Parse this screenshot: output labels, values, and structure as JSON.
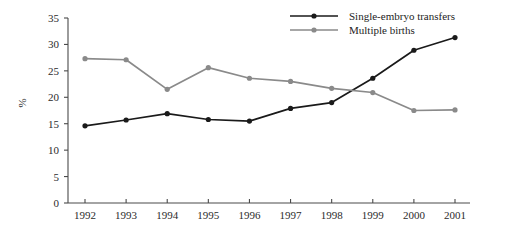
{
  "chart_data": {
    "type": "line",
    "title": "",
    "xlabel": "",
    "ylabel": "%",
    "categories": [
      "1992",
      "1993",
      "1994",
      "1995",
      "1996",
      "1997",
      "1998",
      "1999",
      "2000",
      "2001"
    ],
    "x": [
      1992,
      1993,
      1994,
      1995,
      1996,
      1997,
      1998,
      1999,
      2000,
      2001
    ],
    "series": [
      {
        "name": "Single-embryo transfers",
        "color": "#1a1a1a",
        "values": [
          14.6,
          15.7,
          16.9,
          15.8,
          15.5,
          17.9,
          19.0,
          23.6,
          28.9,
          31.3
        ]
      },
      {
        "name": "Multiple births",
        "color": "#8a8a8a",
        "values": [
          27.3,
          27.1,
          21.5,
          25.6,
          23.6,
          23.0,
          21.7,
          20.9,
          17.5,
          17.6
        ]
      }
    ],
    "ylim": [
      0,
      35
    ],
    "yticks": [
      0,
      5,
      10,
      15,
      20,
      25,
      30,
      35
    ],
    "ytick_labels": [
      "0",
      "5",
      "10",
      "15",
      "20",
      "25",
      "30",
      "35"
    ],
    "grid": false,
    "legend_position": "top-right",
    "marker": "circle"
  },
  "axes": {
    "y_title": "%"
  },
  "legend": {
    "entries": [
      {
        "label": "Single-embryo transfers",
        "color": "#1a1a1a"
      },
      {
        "label": "Multiple births",
        "color": "#8a8a8a"
      }
    ]
  }
}
